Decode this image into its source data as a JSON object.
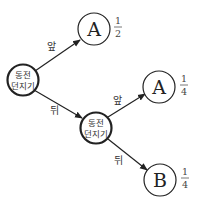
{
  "diagram": {
    "type": "probability-tree",
    "nodes": {
      "root": {
        "line1": "동전",
        "line2": "던지기"
      },
      "second": {
        "line1": "동전",
        "line2": "던지기"
      },
      "outcome_top": {
        "label": "A",
        "prob_num": "1",
        "prob_den": "2"
      },
      "outcome_mid": {
        "label": "A",
        "prob_num": "1",
        "prob_den": "4"
      },
      "outcome_bottom": {
        "label": "B",
        "prob_num": "1",
        "prob_den": "4"
      }
    },
    "edges": {
      "root_to_top": "앞",
      "root_to_second": "뒤",
      "second_to_mid": "앞",
      "second_to_bottom": "뒤"
    },
    "colors": {
      "stroke": "#222222",
      "background": "#ffffff"
    }
  }
}
